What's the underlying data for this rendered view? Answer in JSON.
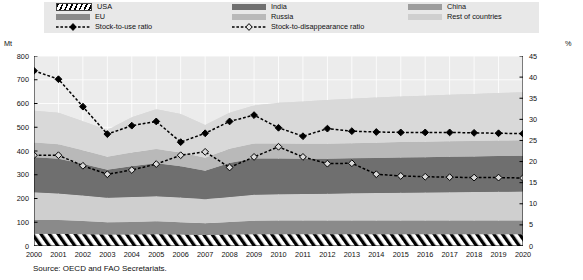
{
  "axes": {
    "left_unit": "Mt",
    "right_unit": "%",
    "left_ticks": [
      "0",
      "100",
      "200",
      "300",
      "400",
      "500",
      "600",
      "700",
      "800"
    ],
    "right_ticks": [
      "0",
      "5",
      "10",
      "15",
      "20",
      "25",
      "30",
      "35",
      "40",
      "45"
    ],
    "x_ticks": [
      "2000",
      "2001",
      "2002",
      "2003",
      "2004",
      "2005",
      "2006",
      "2007",
      "2008",
      "2009",
      "2010",
      "2011",
      "2012",
      "2013",
      "2014",
      "2015",
      "2016",
      "2017",
      "2018",
      "2019",
      "2020"
    ]
  },
  "legend": {
    "col1": [
      {
        "name": "USA",
        "swatch": "hatch",
        "color": "#ffffff"
      },
      {
        "name": "EU",
        "swatch": "fill",
        "color": "#8a8a8a"
      },
      {
        "name": "Stock-to-use ratio",
        "swatch": "line-filled",
        "color": "#000000"
      }
    ],
    "col2": [
      {
        "name": "India",
        "swatch": "fill",
        "color": "#6f6f6f"
      },
      {
        "name": "Russia",
        "swatch": "fill",
        "color": "#b9b9b9"
      },
      {
        "name": "Stock-to-disappearance ratio",
        "swatch": "line-open",
        "color": "#000000"
      }
    ],
    "col3": [
      {
        "name": "China",
        "swatch": "fill",
        "color": "#9d9d9d"
      },
      {
        "name": "Rest of countries",
        "swatch": "fill",
        "color": "#cfcfcf"
      }
    ]
  },
  "source": "Source:  OECD and FAO Secretariats.",
  "chart_data": {
    "type": "area",
    "title": "",
    "subtitle": "",
    "xlabel": "",
    "ylabel": "Mt",
    "y2label": "%",
    "ylim": [
      0,
      800
    ],
    "y2lim": [
      0,
      45
    ],
    "grid": true,
    "legend_position": "top",
    "x": [
      "2000",
      "2001",
      "2002",
      "2003",
      "2004",
      "2005",
      "2006",
      "2007",
      "2008",
      "2009",
      "2010",
      "2011",
      "2012",
      "2013",
      "2014",
      "2015",
      "2016",
      "2017",
      "2018",
      "2019",
      "2020"
    ],
    "stack_order_bottom_to_top": [
      "USA",
      "EU",
      "China",
      "India",
      "Russia",
      "Rest of countries"
    ],
    "series": [
      {
        "name": "USA",
        "axis": "left",
        "color": "#ffffff",
        "pattern": "hatch",
        "values": [
          52,
          52,
          50,
          48,
          48,
          50,
          48,
          46,
          48,
          50,
          50,
          50,
          50,
          50,
          50,
          50,
          50,
          50,
          50,
          50,
          50
        ]
      },
      {
        "name": "EU",
        "axis": "left",
        "color": "#8a8a8a",
        "values": [
          58,
          57,
          55,
          52,
          53,
          54,
          52,
          50,
          53,
          56,
          57,
          57,
          57,
          57,
          57,
          57,
          57,
          57,
          57,
          57,
          57
        ]
      },
      {
        "name": "China",
        "axis": "left",
        "color": "#cfcfcf",
        "values": [
          116,
          112,
          108,
          103,
          105,
          106,
          104,
          101,
          105,
          110,
          111,
          112,
          113,
          115,
          116,
          117,
          118,
          119,
          120,
          121,
          122
        ]
      },
      {
        "name": "India",
        "axis": "left",
        "color": "#6f6f6f",
        "values": [
          148,
          146,
          132,
          118,
          130,
          138,
          132,
          120,
          143,
          152,
          150,
          148,
          147,
          147,
          148,
          149,
          149,
          150,
          150,
          151,
          151
        ]
      },
      {
        "name": "Russia",
        "axis": "left",
        "color": "#b9b9b9",
        "values": [
          62,
          61,
          58,
          55,
          58,
          60,
          58,
          55,
          60,
          64,
          64,
          64,
          64,
          64,
          64,
          65,
          65,
          65,
          65,
          65,
          65
        ]
      },
      {
        "name": "Rest of countries",
        "axis": "left",
        "color": "#d9d9d9",
        "values": [
          134,
          133,
          122,
          112,
          148,
          168,
          162,
          138,
          152,
          160,
          171,
          177,
          184,
          187,
          190,
          192,
          194,
          196,
          198,
          200,
          202
        ]
      }
    ],
    "lines": [
      {
        "name": "Stock-to-use ratio",
        "axis": "right",
        "marker": "diamond-filled",
        "color": "#000000",
        "values": [
          41.5,
          39.5,
          33.0,
          26.5,
          28.5,
          29.5,
          24.6,
          26.7,
          29.5,
          31.0,
          28.0,
          26.0,
          27.8,
          27.2,
          27.0,
          26.9,
          26.9,
          26.9,
          26.8,
          26.7,
          26.6
        ]
      },
      {
        "name": "Stock-to-disappearance ratio",
        "axis": "right",
        "marker": "diamond-open",
        "color": "#000000",
        "values": [
          21.5,
          21.5,
          19.0,
          17.0,
          18.0,
          19.4,
          21.5,
          22.3,
          18.6,
          21.1,
          23.5,
          21.1,
          19.5,
          19.6,
          17.0,
          16.6,
          16.4,
          16.3,
          16.2,
          16.2,
          16.1
        ]
      }
    ]
  }
}
